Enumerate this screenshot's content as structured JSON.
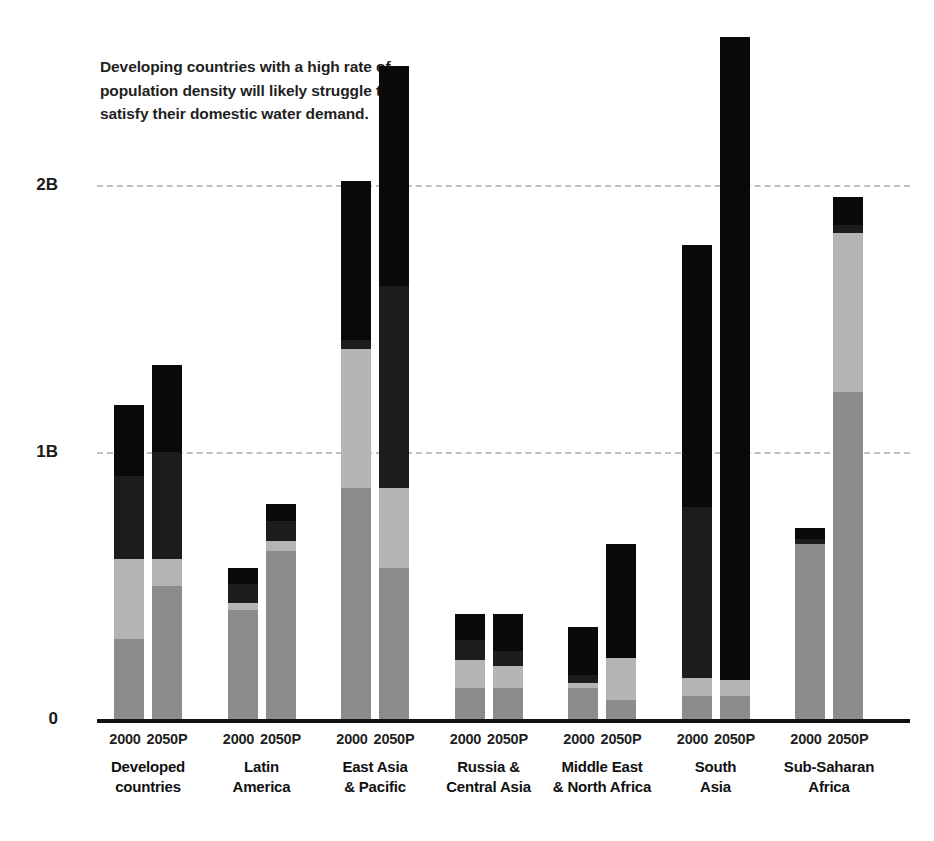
{
  "annotation": {
    "line1": "Developing countries with a high rate of",
    "line2": "population density will likely struggle to",
    "line3": "satisfy their domestic water demand."
  },
  "axis": {
    "y_ticks": [
      "2B",
      "1B",
      "0"
    ],
    "y_tick_values": [
      2,
      1,
      0
    ],
    "period_labels": [
      "2000",
      "2050P"
    ]
  },
  "colors": {
    "background": "#ffffff",
    "segment_1": "#8c8c8c",
    "segment_2": "#b4b4b4",
    "segment_3": "#1c1c1c",
    "segment_4": "#090909",
    "gridline": "#bfbfbf",
    "axis": "#111111",
    "text": "#1a1a1a"
  },
  "chart_data": {
    "type": "bar",
    "subtype": "grouped-stacked",
    "title": "",
    "xlabel": "",
    "ylabel": "",
    "ylim": [
      0,
      2.45
    ],
    "yunit": "billions of people",
    "grid": true,
    "legend": "none",
    "ytick_labels": [
      "0",
      "1B",
      "2B"
    ],
    "ytick_positions": [
      0,
      1,
      2
    ],
    "categories": [
      "Developed countries",
      "Latin America",
      "East Asia & Pacific",
      "Russia & Central Asia",
      "Middle East & North Africa",
      "South Asia",
      "Sub-Saharan Africa"
    ],
    "periods": [
      "2000",
      "2050P"
    ],
    "stack_order_bottom_to_top": [
      "segment_1",
      "segment_2",
      "segment_3",
      "segment_4"
    ],
    "groups": [
      {
        "category": "Developed countries",
        "bars": [
          {
            "period": "2000",
            "total": 1.175,
            "segments": [
              0.3,
              0.3,
              0.31,
              0.265
            ]
          },
          {
            "period": "2050P",
            "total": 1.325,
            "segments": [
              0.5,
              0.1,
              0.4,
              0.325
            ]
          }
        ]
      },
      {
        "category": "Latin America",
        "bars": [
          {
            "period": "2000",
            "total": 0.565,
            "segments": [
              0.41,
              0.025,
              0.07,
              0.06
            ]
          },
          {
            "period": "2050P",
            "total": 0.805,
            "segments": [
              0.63,
              0.035,
              0.075,
              0.065
            ]
          }
        ]
      },
      {
        "category": "East Asia & Pacific",
        "bars": [
          {
            "period": "2000",
            "total": 2.015,
            "segments": [
              0.865,
              0.52,
              0.035,
              0.595
            ]
          },
          {
            "period": "2050P",
            "total": 2.445,
            "segments": [
              0.565,
              0.3,
              0.755,
              0.825
            ]
          }
        ]
      },
      {
        "category": "Russia & Central Asia",
        "bars": [
          {
            "period": "2000",
            "total": 0.395,
            "segments": [
              0.115,
              0.105,
              0.075,
              0.1
            ]
          },
          {
            "period": "2050P",
            "total": 0.395,
            "segments": [
              0.115,
              0.085,
              0.055,
              0.14
            ]
          }
        ]
      },
      {
        "category": "Middle East & North Africa",
        "bars": [
          {
            "period": "2000",
            "total": 0.345,
            "segments": [
              0.115,
              0.02,
              0.03,
              0.18
            ]
          },
          {
            "period": "2050P",
            "total": 0.655,
            "segments": [
              0.07,
              0.16,
              0.0,
              0.425
            ]
          }
        ]
      },
      {
        "category": "South Asia",
        "bars": [
          {
            "period": "2000",
            "total": 1.775,
            "segments": [
              0.085,
              0.07,
              0.64,
              0.98
            ]
          },
          {
            "period": "2050P",
            "total": 2.555,
            "segments": [
              0.085,
              0.06,
              0.0,
              2.41
            ]
          }
        ]
      },
      {
        "category": "Sub-Saharan Africa",
        "bars": [
          {
            "period": "2000",
            "total": 0.715,
            "segments": [
              0.655,
              0.0,
              0.02,
              0.04
            ]
          },
          {
            "period": "2050P",
            "total": 1.955,
            "segments": [
              1.225,
              0.595,
              0.03,
              0.105
            ]
          }
        ]
      }
    ]
  }
}
